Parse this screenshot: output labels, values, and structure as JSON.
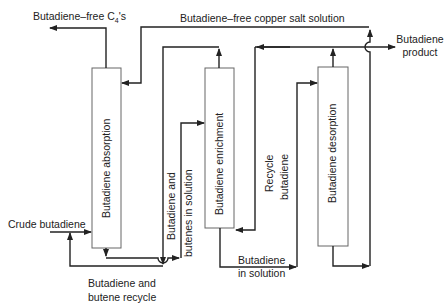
{
  "diagram": {
    "type": "process-flow",
    "units": [
      {
        "id": "absorption",
        "label": "Butadiene absorption"
      },
      {
        "id": "enrichment",
        "label": "Butadiene enrichment"
      },
      {
        "id": "desorption",
        "label": "Butadiene desorption"
      }
    ],
    "streams": {
      "butadiene_free_c4": {
        "label_main": "Butadiene–free C",
        "label_sub": "4",
        "label_tail": "'s"
      },
      "copper_salt": {
        "label": "Butadiene–free copper salt solution"
      },
      "product": {
        "line1": "Butadiene",
        "line2": "product"
      },
      "crude": {
        "label": "Crude butadiene"
      },
      "recycle_c4": {
        "line1": "Butadiene and",
        "line2": "butene recycle"
      },
      "butenes_solution": {
        "line1": "Butadiene and",
        "line2": "butenes in solution"
      },
      "recycle_butadiene": {
        "line1": "Recycle",
        "line2": "butadiene"
      },
      "butadiene_solution": {
        "line1": "Butadiene",
        "line2": "in solution"
      }
    },
    "colors": {
      "line": "#222222",
      "box": "#555555",
      "background": "#ffffff"
    }
  }
}
